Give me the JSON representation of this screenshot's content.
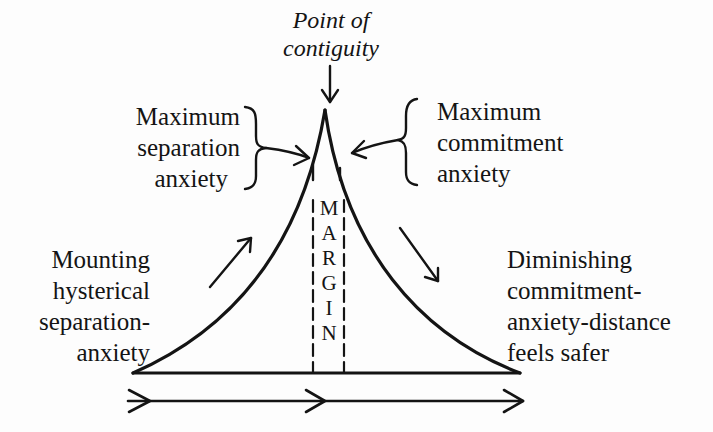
{
  "diagram": {
    "top_label": {
      "lines": [
        "Point of",
        "contiguity"
      ]
    },
    "left_upper_label": {
      "lines": [
        "Maximum",
        "separation",
        "anxiety"
      ]
    },
    "right_upper_label": {
      "lines": [
        "Maximum",
        "commitment",
        "anxiety"
      ]
    },
    "left_lower_label": {
      "lines": [
        "Mounting",
        "hysterical",
        "separation-",
        "anxiety"
      ]
    },
    "right_lower_label": {
      "lines": [
        "Diminishing",
        "commitment-",
        "anxiety-distance",
        "feels safer"
      ]
    },
    "margin_label": {
      "letters": [
        "M",
        "A",
        "R",
        "G",
        "I",
        "N"
      ]
    },
    "colors": {
      "ink": "#141414",
      "background": "#fdfdfd"
    }
  }
}
